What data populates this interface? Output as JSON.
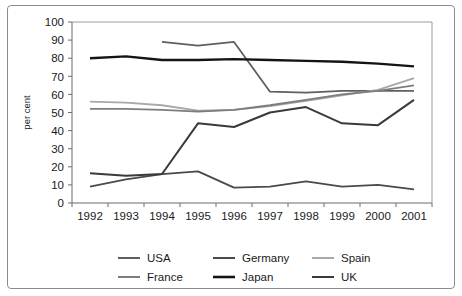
{
  "chart_data": {
    "type": "line",
    "title": "",
    "xlabel": "",
    "ylabel": "per cent",
    "categories": [
      "1992",
      "1993",
      "1994",
      "1995",
      "1996",
      "1997",
      "1998",
      "1999",
      "2000",
      "2001"
    ],
    "x": [
      1992,
      1993,
      1994,
      1995,
      1996,
      1997,
      1998,
      1999,
      2000,
      2001
    ],
    "ylim": [
      0,
      100
    ],
    "yticks": [
      0,
      10,
      20,
      30,
      40,
      50,
      60,
      70,
      80,
      90,
      100
    ],
    "ytick_labels": [
      "0",
      "10",
      "20",
      "30",
      "40",
      "50",
      "60",
      "70",
      "80",
      "90",
      "100"
    ],
    "grid": false,
    "legend_position": "bottom",
    "series": [
      {
        "name": "USA",
        "color": "#5f5f5f",
        "width": 1.8,
        "values": [
          null,
          null,
          89,
          87,
          89,
          61.5,
          61,
          62,
          62,
          62
        ]
      },
      {
        "name": "Germany",
        "color": "#4a4a4a",
        "width": 1.8,
        "values": [
          9,
          13,
          16,
          17.5,
          8.5,
          9,
          12,
          9,
          10,
          7.5
        ]
      },
      {
        "name": "Spain",
        "color": "#a8a8a8",
        "width": 1.8,
        "values": [
          56,
          55.5,
          54,
          51,
          51.5,
          53.5,
          56.5,
          59.5,
          62.5,
          69
        ]
      },
      {
        "name": "France",
        "color": "#7d7d7d",
        "width": 1.8,
        "values": [
          52,
          52,
          51.5,
          50.5,
          51.5,
          54,
          57,
          60,
          62,
          65
        ]
      },
      {
        "name": "Japan",
        "color": "#141414",
        "width": 2.4,
        "values": [
          80,
          81,
          79,
          79,
          79.5,
          79,
          78.5,
          78,
          77,
          75.5
        ]
      },
      {
        "name": "UK",
        "color": "#3a3a3a",
        "width": 2.0,
        "values": [
          16.5,
          15,
          16,
          44,
          42,
          50,
          53,
          44,
          43,
          57
        ]
      }
    ]
  },
  "legend": {
    "rows": [
      [
        {
          "label": "USA",
          "color": "#5f5f5f"
        },
        {
          "label": "Germany",
          "color": "#4a4a4a"
        },
        {
          "label": "Spain",
          "color": "#a8a8a8"
        }
      ],
      [
        {
          "label": "France",
          "color": "#7d7d7d"
        },
        {
          "label": "Japan",
          "color": "#141414"
        },
        {
          "label": "UK",
          "color": "#3a3a3a"
        }
      ]
    ]
  },
  "frame": {
    "border_color": "#8c8c8c",
    "background": "#ffffff"
  }
}
